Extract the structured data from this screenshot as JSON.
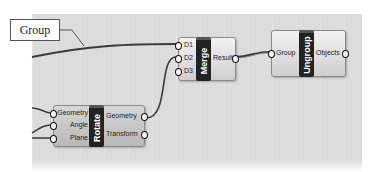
{
  "callout": {
    "label": "Group"
  },
  "nodes": {
    "merge": {
      "name": "Merge",
      "inputs": [
        "D1",
        "D2",
        "D3"
      ],
      "outputs": [
        "Result"
      ]
    },
    "ungroup": {
      "name": "Ungroup",
      "inputs": [
        "Group"
      ],
      "outputs": [
        "Objects"
      ]
    },
    "rotate": {
      "name": "Rotate",
      "inputs": [
        "Geometry",
        "Angle",
        "Plane"
      ],
      "outputs": [
        "Geometry",
        "Transform"
      ]
    }
  },
  "colors": {
    "canvas": "#dcdcdc",
    "node_fill": "#e6e6e6",
    "node_core": "#222222",
    "wire": "#3a3a3a"
  }
}
